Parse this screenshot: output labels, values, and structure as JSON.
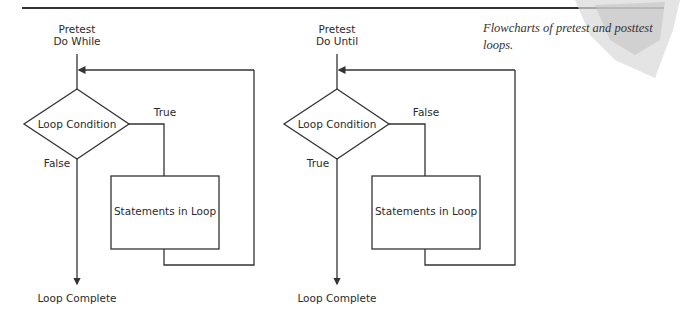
{
  "caption": {
    "line1": "Flowcharts of pretest and posttest",
    "line2": "loops."
  },
  "left_flowchart": {
    "title_line1": "Pretest",
    "title_line2": "Do While",
    "decision": "Loop Condition",
    "branch_into_loop": "True",
    "branch_exit": "False",
    "process": "Statements in Loop",
    "terminal": "Loop Complete"
  },
  "right_flowchart": {
    "title_line1": "Pretest",
    "title_line2": "Do Until",
    "decision": "Loop Condition",
    "branch_into_loop": "False",
    "branch_exit": "True",
    "process": "Statements in Loop",
    "terminal": "Loop Complete"
  },
  "colors": {
    "line": "#333333",
    "text": "#2a2a2a",
    "background": "#ffffff"
  }
}
